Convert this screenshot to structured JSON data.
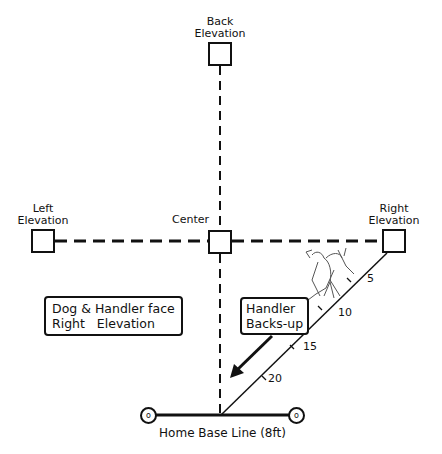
{
  "diagram": {
    "stations": {
      "back": {
        "line1": "Back",
        "line2": "Elevation"
      },
      "left": {
        "line1": "Left",
        "line2": "Elevation"
      },
      "center": {
        "label": "Center"
      },
      "right": {
        "line1": "Right",
        "line2": "Elevation"
      }
    },
    "notes": {
      "face": {
        "line1": "Dog & Handler face",
        "line2": "Right   Elevation"
      },
      "backs_up": {
        "line1": "Handler",
        "line2": "Backs-up"
      }
    },
    "distance_marks": [
      "5",
      "10",
      "15",
      "20"
    ],
    "home_base": {
      "label": "Home Base Line (8ft)",
      "post_glyph": "o"
    },
    "colors": {
      "line": "#111111",
      "background": "#ffffff"
    }
  }
}
